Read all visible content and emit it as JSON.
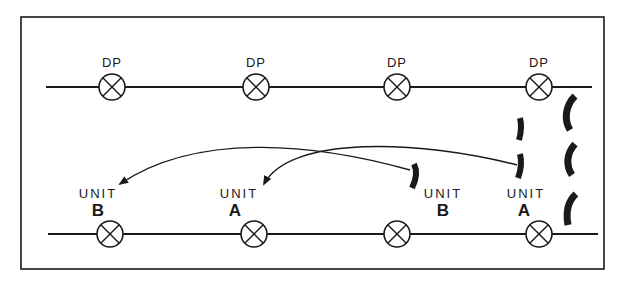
{
  "diagram": {
    "type": "tactical-relief-in-place",
    "colors": {
      "ink": "#1a1a1a",
      "background": "#ffffff"
    },
    "top_line": {
      "label_text": "DP",
      "points": [
        {
          "label": "DP",
          "x": 112
        },
        {
          "label": "DP",
          "x": 256
        },
        {
          "label": "DP",
          "x": 397
        },
        {
          "label": "DP",
          "x": 539
        }
      ]
    },
    "bottom_line": {
      "points": [
        {
          "x": 110
        },
        {
          "x": 254
        },
        {
          "x": 397
        },
        {
          "x": 539
        }
      ]
    },
    "units": [
      {
        "id": "unit-b-new",
        "word": "UNIT",
        "letter": "B",
        "position": "bottom-left"
      },
      {
        "id": "unit-a-new",
        "word": "UNIT",
        "letter": "A",
        "position": "bottom-center-left"
      },
      {
        "id": "unit-b-old",
        "word": "UNIT",
        "letter": "B",
        "position": "bottom-center-right"
      },
      {
        "id": "unit-a-old",
        "word": "UNIT",
        "letter": "A",
        "position": "bottom-right"
      }
    ],
    "arrows": [
      {
        "from": "unit-b-old",
        "to": "unit-b-new"
      },
      {
        "from": "unit-a-old",
        "to": "unit-a-new"
      }
    ],
    "front_line_arcs": {
      "count": 3
    },
    "unit_position_marks": {
      "count": 3
    }
  }
}
